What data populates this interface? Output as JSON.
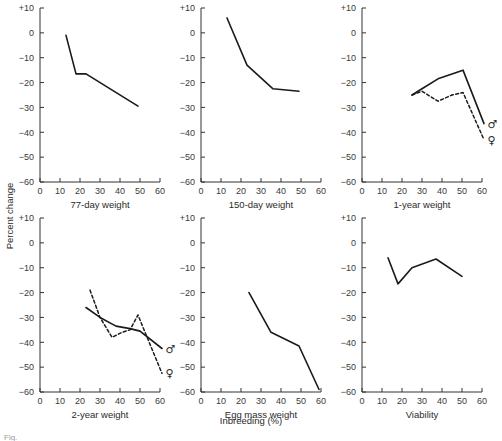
{
  "figure": {
    "shared_xlabel": "Inbreeding (%)",
    "shared_ylabel": "Percent change",
    "caption_fragment": "Fig.",
    "line_color": "#1a1a1a",
    "axis_color": "#333333",
    "background": "#ffffff",
    "male_symbol": "♂",
    "female_symbol": "♀",
    "male_symbol_name": "mars-symbol",
    "female_symbol_name": "venus-symbol"
  },
  "axes": {
    "x": {
      "min": 0,
      "max": 60,
      "ticks": [
        0,
        10,
        20,
        30,
        40,
        50,
        60
      ],
      "ticklabels": [
        "0",
        "10",
        "20",
        "30",
        "40",
        "50",
        "60"
      ]
    },
    "y": {
      "min": -60,
      "max": 10,
      "ticks": [
        10,
        0,
        -10,
        -20,
        -30,
        -40,
        -50,
        -60
      ],
      "ticklabels": [
        "+10",
        "0",
        "−10",
        "−20",
        "−30",
        "−40",
        "−50",
        "−60"
      ]
    }
  },
  "chart_data": [
    {
      "id": "panel-77-day-weight",
      "type": "line",
      "title": "77-day weight",
      "xlabel": "Inbreeding (%)",
      "ylabel": "Percent change",
      "xlim": [
        0,
        60
      ],
      "ylim": [
        -60,
        10
      ],
      "grid": false,
      "legend": "none",
      "series": [
        {
          "name": "combined",
          "style": "solid",
          "marker_label": "",
          "x": [
            13,
            18,
            23,
            49
          ],
          "y": [
            -1,
            -16.5,
            -16.5,
            -29.5
          ]
        }
      ]
    },
    {
      "id": "panel-150-day-weight",
      "type": "line",
      "title": "150-day weight",
      "xlabel": "Inbreeding (%)",
      "ylabel": "Percent change",
      "xlim": [
        0,
        60
      ],
      "ylim": [
        -60,
        10
      ],
      "grid": false,
      "legend": "none",
      "series": [
        {
          "name": "combined",
          "style": "solid",
          "marker_label": "",
          "x": [
            13,
            23,
            36,
            49
          ],
          "y": [
            6,
            -13,
            -22.5,
            -23.5
          ]
        }
      ]
    },
    {
      "id": "panel-1-year-weight",
      "type": "line",
      "title": "1-year weight",
      "xlabel": "Inbreeding (%)",
      "ylabel": "Percent change",
      "xlim": [
        0,
        60
      ],
      "ylim": [
        -60,
        10
      ],
      "grid": false,
      "legend": "symbols-at-line-end",
      "series": [
        {
          "name": "males",
          "style": "solid",
          "marker_label": "♂",
          "x": [
            25,
            30,
            38,
            50.5,
            61
          ],
          "y": [
            -25,
            -22.5,
            -18.5,
            -15,
            -36.5
          ]
        },
        {
          "name": "females",
          "style": "dashed",
          "marker_label": "♀",
          "x": [
            25,
            30,
            38,
            45,
            50.5,
            61
          ],
          "y": [
            -25,
            -23.5,
            -27.5,
            -25,
            -24,
            -43
          ]
        }
      ]
    },
    {
      "id": "panel-2-year-weight",
      "type": "line",
      "title": "2-year weight",
      "xlabel": "Inbreeding (%)",
      "ylabel": "Percent change",
      "xlim": [
        0,
        60
      ],
      "ylim": [
        -60,
        10
      ],
      "grid": false,
      "legend": "symbols-at-line-end",
      "series": [
        {
          "name": "males",
          "style": "solid",
          "marker_label": "♂",
          "x": [
            23,
            30,
            38,
            45,
            50,
            61
          ],
          "y": [
            -26,
            -30,
            -33.5,
            -34.5,
            -35.5,
            -42.5
          ]
        },
        {
          "name": "females",
          "style": "dashed",
          "marker_label": "♀",
          "x": [
            25,
            30,
            36,
            41,
            45,
            49,
            51,
            61
          ],
          "y": [
            -19,
            -30,
            -38,
            -36,
            -35,
            -29,
            -33,
            -52.5
          ]
        }
      ]
    },
    {
      "id": "panel-egg-mass-weight",
      "type": "line",
      "title": "Egg mass weight",
      "xlabel": "Inbreeding (%)",
      "ylabel": "Percent change",
      "xlim": [
        0,
        60
      ],
      "ylim": [
        -60,
        10
      ],
      "grid": false,
      "legend": "none",
      "series": [
        {
          "name": "combined",
          "style": "solid",
          "marker_label": "",
          "x": [
            24,
            35,
            49,
            59
          ],
          "y": [
            -20,
            -36,
            -41.5,
            -59
          ]
        }
      ]
    },
    {
      "id": "panel-viability",
      "type": "line",
      "title": "Viability",
      "xlabel": "Inbreeding (%)",
      "ylabel": "Percent change",
      "xlim": [
        0,
        60
      ],
      "ylim": [
        -60,
        10
      ],
      "grid": false,
      "legend": "none",
      "series": [
        {
          "name": "combined",
          "style": "solid",
          "marker_label": "",
          "x": [
            13,
            18,
            25,
            37,
            50
          ],
          "y": [
            -6,
            -16.5,
            -10,
            -6.5,
            -13.5
          ]
        }
      ]
    }
  ]
}
